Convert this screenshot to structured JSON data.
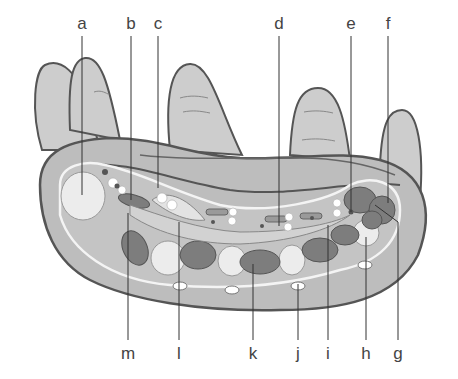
{
  "diagram": {
    "labels_top": [
      {
        "id": "a",
        "text": "a",
        "x": 82
      },
      {
        "id": "b",
        "text": "b",
        "x": 131
      },
      {
        "id": "c",
        "text": "c",
        "x": 158
      },
      {
        "id": "d",
        "text": "d",
        "x": 279
      },
      {
        "id": "e",
        "text": "e",
        "x": 351
      },
      {
        "id": "f",
        "text": "f",
        "x": 388
      }
    ],
    "labels_bottom": [
      {
        "id": "m",
        "text": "m",
        "x": 128
      },
      {
        "id": "l",
        "text": "l",
        "x": 179
      },
      {
        "id": "k",
        "text": "k",
        "x": 253
      },
      {
        "id": "j",
        "text": "j",
        "x": 298
      },
      {
        "id": "i",
        "text": "i",
        "x": 328
      },
      {
        "id": "h",
        "text": "h",
        "x": 366
      },
      {
        "id": "g",
        "text": "g",
        "x": 398
      }
    ],
    "colors": {
      "skin": "#c9c9c9",
      "outline": "#555555",
      "dark_tissue": "#7a7a7a",
      "bone": "#e8e8e8",
      "line": "#333333"
    }
  }
}
